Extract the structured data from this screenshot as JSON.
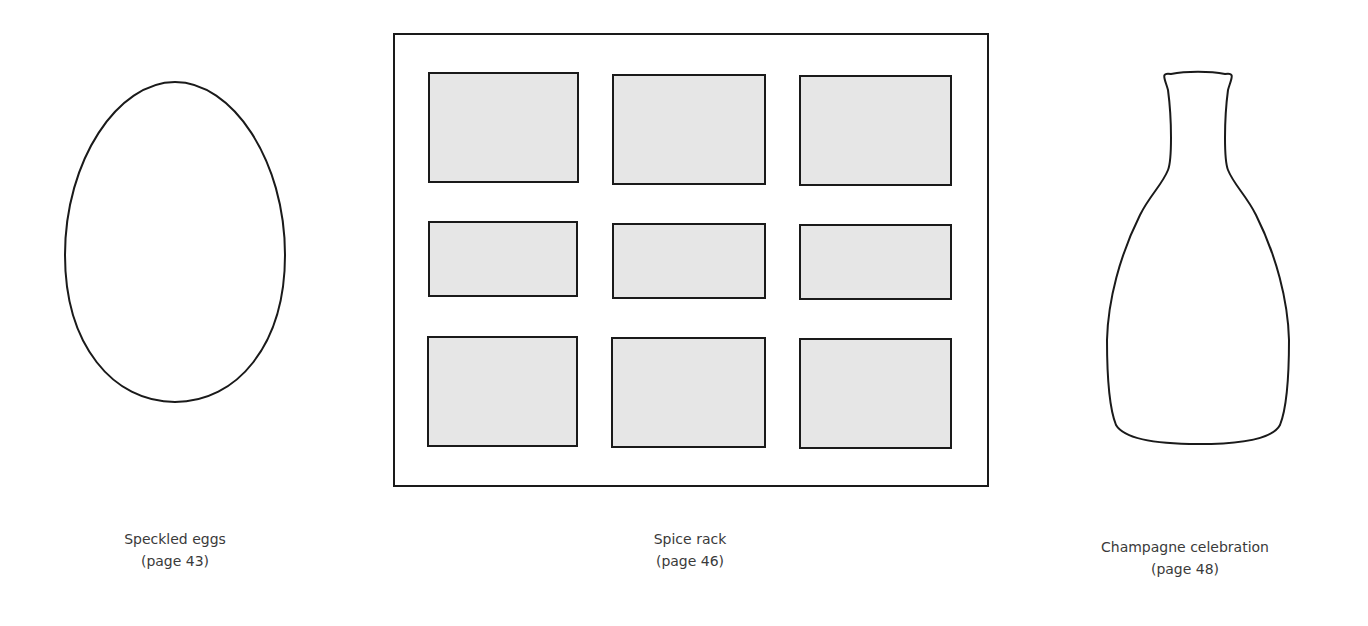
{
  "templates": [
    {
      "name": "Speckled eggs",
      "page": "(page 43)",
      "shape": "egg-outline"
    },
    {
      "name": "Spice rack",
      "page": "(page 46)",
      "shape": "spice-rack-grid"
    },
    {
      "name": "Champagne celebration",
      "page": "(page 48)",
      "shape": "bottle-outline"
    }
  ],
  "colors": {
    "stroke": "#1a1a1a",
    "fill_panel": "#e6e6e6",
    "background": "#ffffff"
  }
}
